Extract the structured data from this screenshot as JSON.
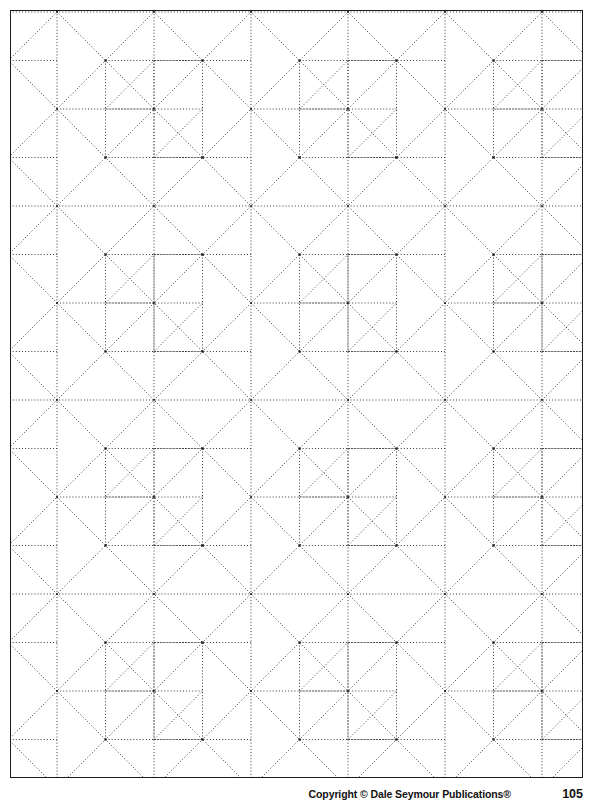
{
  "page": {
    "background_color": "#ffffff",
    "border_color": "#1a1a1a",
    "width": 598,
    "height": 806
  },
  "footer": {
    "copyright": "Copyright © Dale Seymour Publications®",
    "page_number": "105"
  },
  "pattern": {
    "name": "pinwheel-tessellation",
    "line_style": "dotted",
    "line_color": "#3a3a3a",
    "node_color": "#111111",
    "grid_unit_px": 48.5,
    "tile_period_px": 194,
    "frame": {
      "x": 10,
      "y": 10,
      "width": 573,
      "height": 768
    },
    "description": "Repeating dotted-line pinwheel motif on a square grid of 48.5 px; motif repeats every 4 grid units (194 px) horizontally and vertically."
  }
}
